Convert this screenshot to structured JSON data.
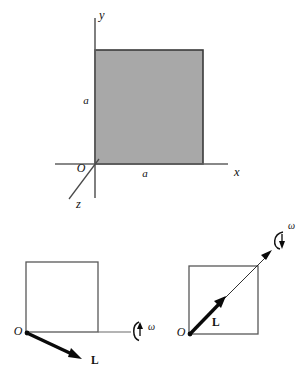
{
  "figure": {
    "background_color": "#ffffff",
    "ink_color": "#111111",
    "shade_color": "#a8a8a8"
  },
  "panel_top": {
    "name": "coordinate-axes-with-shaded-square",
    "axis_labels": {
      "y": "y",
      "x": "x",
      "z": "z"
    },
    "origin_label": "O",
    "dimension_labels": {
      "vertical": "a",
      "horizontal": "a"
    },
    "square": {
      "fill": "#a8a8a8",
      "side_label": "a"
    }
  },
  "panel_bottom_left": {
    "name": "spin-about-edge-axis",
    "origin_label": "O",
    "vector_label": "L",
    "omega_label": "ω",
    "spin_axis": "horizontal-edge"
  },
  "panel_bottom_right": {
    "name": "spin-about-diagonal-axis",
    "origin_label": "O",
    "vector_label": "L",
    "omega_label": "ω",
    "spin_axis": "diagonal"
  },
  "icons": {
    "spin_arrow": "curved-rotation-arrow-icon",
    "vector_arrow": "vector-arrowhead-icon",
    "origin_point": "origin-dot-icon"
  }
}
